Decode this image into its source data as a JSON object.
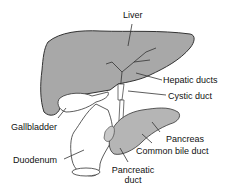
{
  "labels": {
    "liver": "Liver",
    "hepatic_ducts": "Hepatic ducts",
    "cystic_duct": "Cystic duct",
    "gallbladder": "Gallbladder",
    "pancreas": "Pancreas",
    "duodenum": "Duodenum",
    "common_bile_duct": "Common bile duct",
    "pancreatic_duct_line1": "Pancreatic",
    "pancreatic_duct_line2": "duct"
  },
  "colors": {
    "liver_fill": "#a8a8a8",
    "outline": "#333333",
    "pancreas_fill": "#b5b5b5",
    "background": "#ffffff"
  }
}
